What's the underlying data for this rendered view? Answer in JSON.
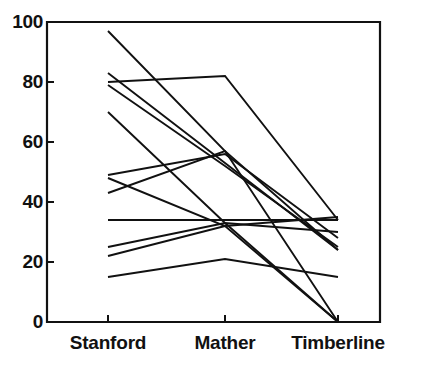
{
  "chart_data": {
    "type": "line",
    "title": "",
    "subtitle": "",
    "xlabel": "",
    "ylabel": "",
    "categories": [
      "Stanford",
      "Mather",
      "Timberline"
    ],
    "x_tick_labels": [
      "Stanford",
      "Mather",
      "Timberline"
    ],
    "y_tick_labels": [
      "0",
      "20",
      "40",
      "60",
      "80",
      "100"
    ],
    "y_tick_values": [
      0,
      20,
      40,
      60,
      80,
      100
    ],
    "ylim": [
      0,
      100
    ],
    "grid": false,
    "legend": "none",
    "legend_position": "none",
    "line_color": "#111111",
    "axis_color": "#111111",
    "background_color": "#ffffff",
    "annotations": [],
    "series": [
      {
        "name": "subject-1",
        "values": [
          97,
          57,
          0
        ]
      },
      {
        "name": "subject-2",
        "values": [
          83,
          53,
          24
        ]
      },
      {
        "name": "subject-3",
        "values": [
          80,
          82,
          34
        ]
      },
      {
        "name": "subject-4",
        "values": [
          79,
          52,
          25
        ]
      },
      {
        "name": "subject-5",
        "values": [
          70,
          33,
          0
        ]
      },
      {
        "name": "subject-6",
        "values": [
          49,
          56,
          28
        ]
      },
      {
        "name": "subject-7",
        "values": [
          48,
          32,
          0
        ]
      },
      {
        "name": "subject-8",
        "values": [
          43,
          57,
          24
        ]
      },
      {
        "name": "subject-9",
        "values": [
          34,
          34,
          34
        ]
      },
      {
        "name": "subject-10",
        "values": [
          25,
          33,
          30
        ]
      },
      {
        "name": "subject-11",
        "values": [
          22,
          32,
          35
        ]
      },
      {
        "name": "subject-12",
        "values": [
          15,
          21,
          15
        ]
      }
    ]
  },
  "axes": {
    "y_axis_name": "y-axis",
    "x_axis_name": "x-axis"
  }
}
